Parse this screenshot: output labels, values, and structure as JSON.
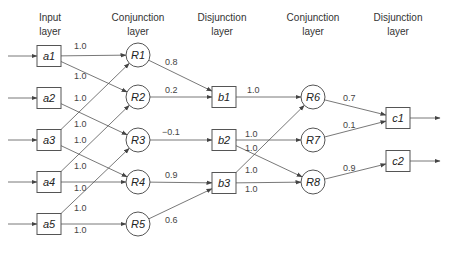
{
  "headers": [
    {
      "line1": "Input",
      "line2": "layer",
      "x": 50
    },
    {
      "line1": "Conjunction",
      "line2": "layer",
      "x": 138
    },
    {
      "line1": "Disjunction",
      "line2": "layer",
      "x": 224
    },
    {
      "line1": "Conjunction",
      "line2": "layer",
      "x": 313
    },
    {
      "line1": "Disjunction",
      "line2": "layer",
      "x": 398
    }
  ],
  "colors": {
    "stroke": "#555555",
    "text": "#333333",
    "background": "#ffffff"
  },
  "nodes": [
    {
      "id": "a1",
      "label": "a1",
      "shape": "box",
      "x": 49,
      "y": 56
    },
    {
      "id": "a2",
      "label": "a2",
      "shape": "box",
      "x": 49,
      "y": 98
    },
    {
      "id": "a3",
      "label": "a3",
      "shape": "box",
      "x": 49,
      "y": 140
    },
    {
      "id": "a4",
      "label": "a4",
      "shape": "box",
      "x": 49,
      "y": 182
    },
    {
      "id": "a5",
      "label": "a5",
      "shape": "box",
      "x": 49,
      "y": 224
    },
    {
      "id": "R1",
      "label": "R1",
      "shape": "circle",
      "x": 138,
      "y": 55
    },
    {
      "id": "R2",
      "label": "R2",
      "shape": "circle",
      "x": 138,
      "y": 97
    },
    {
      "id": "R3",
      "label": "R3",
      "shape": "circle",
      "x": 138,
      "y": 140
    },
    {
      "id": "R4",
      "label": "R4",
      "shape": "circle",
      "x": 138,
      "y": 182
    },
    {
      "id": "R5",
      "label": "R5",
      "shape": "circle",
      "x": 138,
      "y": 224
    },
    {
      "id": "b1",
      "label": "b1",
      "shape": "box",
      "x": 224,
      "y": 97
    },
    {
      "id": "b2",
      "label": "b2",
      "shape": "box",
      "x": 224,
      "y": 140
    },
    {
      "id": "b3",
      "label": "b3",
      "shape": "box",
      "x": 224,
      "y": 183
    },
    {
      "id": "R6",
      "label": "R6",
      "shape": "circle",
      "x": 313,
      "y": 97
    },
    {
      "id": "R7",
      "label": "R7",
      "shape": "circle",
      "x": 313,
      "y": 140
    },
    {
      "id": "R8",
      "label": "R8",
      "shape": "circle",
      "x": 313,
      "y": 182
    },
    {
      "id": "c1",
      "label": "c1",
      "shape": "box",
      "x": 398,
      "y": 118
    },
    {
      "id": "c2",
      "label": "c2",
      "shape": "box",
      "x": 398,
      "y": 161
    }
  ],
  "edges": [
    {
      "from": "a1",
      "to": "R1",
      "weight": "1.0",
      "lx": 74,
      "ly": 49
    },
    {
      "from": "a1",
      "to": "R2",
      "weight": "1.0",
      "lx": 74,
      "ly": 79
    },
    {
      "from": "a2",
      "to": "R3",
      "weight": "1.0",
      "lx": 74,
      "ly": 101
    },
    {
      "from": "a3",
      "to": "R1",
      "weight": "1.0",
      "lx": 74,
      "ly": 127
    },
    {
      "from": "a3",
      "to": "R4",
      "weight": "1.0",
      "lx": 74,
      "ly": 143
    },
    {
      "from": "a4",
      "to": "R2",
      "weight": "1.0",
      "lx": 74,
      "ly": 169
    },
    {
      "from": "a4",
      "to": "R4",
      "weight": "1.0",
      "lx": 74,
      "ly": 191
    },
    {
      "from": "a5",
      "to": "R3",
      "weight": "1.0",
      "lx": 74,
      "ly": 211
    },
    {
      "from": "a5",
      "to": "R5",
      "weight": "1.0",
      "lx": 74,
      "ly": 233
    },
    {
      "from": "R1",
      "to": "b1",
      "weight": "0.8",
      "lx": 165,
      "ly": 65
    },
    {
      "from": "R2",
      "to": "b1",
      "weight": "0.2",
      "lx": 165,
      "ly": 93
    },
    {
      "from": "R3",
      "to": "b2",
      "weight": "−0.1",
      "lx": 162,
      "ly": 135
    },
    {
      "from": "R4",
      "to": "b3",
      "weight": "0.9",
      "lx": 165,
      "ly": 178
    },
    {
      "from": "R5",
      "to": "b3",
      "weight": "0.6",
      "lx": 165,
      "ly": 223
    },
    {
      "from": "b1",
      "to": "R6",
      "weight": "1.0",
      "lx": 247,
      "ly": 93
    },
    {
      "from": "b2",
      "to": "R7",
      "weight": "1.0",
      "lx": 245,
      "ly": 137
    },
    {
      "from": "b2",
      "to": "R8",
      "weight": "1.0",
      "lx": 245,
      "ly": 151
    },
    {
      "from": "b3",
      "to": "R6",
      "weight": "1.0",
      "lx": 245,
      "ly": 173
    },
    {
      "from": "b3",
      "to": "R8",
      "weight": "1.0",
      "lx": 245,
      "ly": 192
    },
    {
      "from": "R6",
      "to": "c1",
      "weight": "0.7",
      "lx": 343,
      "ly": 101
    },
    {
      "from": "R7",
      "to": "c1",
      "weight": "0.1",
      "lx": 343,
      "ly": 128
    },
    {
      "from": "R8",
      "to": "c2",
      "weight": "0.9",
      "lx": 343,
      "ly": 171
    }
  ],
  "inputs": [
    "a1",
    "a2",
    "a3",
    "a4",
    "a5"
  ],
  "outputs": [
    "c1",
    "c2"
  ]
}
